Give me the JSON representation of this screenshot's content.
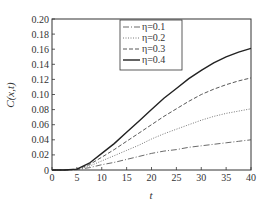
{
  "chart_data": {
    "type": "line",
    "title": "",
    "xlabel": "t",
    "ylabel": "C(x,t)",
    "xlim": [
      0,
      40
    ],
    "ylim": [
      0,
      0.2
    ],
    "xticks": [
      "0",
      "5",
      "10",
      "15",
      "20",
      "25",
      "30",
      "35",
      "40"
    ],
    "yticks": [
      "0",
      "0.02",
      "0.04",
      "0.06",
      "0.08",
      "0.10",
      "0.12",
      "0.14",
      "0.16",
      "0.18",
      "0.20"
    ],
    "grid": false,
    "legend_position": "upper center-right",
    "x": [
      0,
      2.5,
      5,
      7.5,
      10,
      12.5,
      15,
      17.5,
      20,
      22.5,
      25,
      27.5,
      30,
      32.5,
      35,
      37.5,
      40
    ],
    "series": [
      {
        "name": "η=0.1",
        "style": "dash-dot",
        "values": [
          0,
          0,
          0.0005,
          0.003,
          0.007,
          0.01,
          0.014,
          0.018,
          0.022,
          0.025,
          0.027,
          0.03,
          0.032,
          0.034,
          0.036,
          0.038,
          0.04
        ]
      },
      {
        "name": "η=0.2",
        "style": "dotted",
        "values": [
          0,
          0,
          0.0008,
          0.005,
          0.012,
          0.019,
          0.026,
          0.033,
          0.041,
          0.048,
          0.054,
          0.06,
          0.066,
          0.071,
          0.075,
          0.078,
          0.081
        ]
      },
      {
        "name": "η=0.3",
        "style": "dashed",
        "values": [
          0,
          0,
          0.001,
          0.007,
          0.017,
          0.027,
          0.038,
          0.049,
          0.06,
          0.071,
          0.081,
          0.091,
          0.1,
          0.107,
          0.113,
          0.118,
          0.122
        ]
      },
      {
        "name": "η=0.4",
        "style": "solid",
        "values": [
          0,
          0,
          0.0012,
          0.009,
          0.022,
          0.035,
          0.05,
          0.065,
          0.08,
          0.095,
          0.108,
          0.121,
          0.132,
          0.142,
          0.15,
          0.156,
          0.161
        ]
      }
    ]
  }
}
